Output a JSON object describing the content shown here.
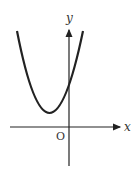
{
  "figure": {
    "x_axis_label": "x",
    "y_axis_label": "y",
    "origin_label": "O",
    "curve": "upward-opening parabola, vertex left of y-axis above x-axis, positive y-intercept"
  }
}
